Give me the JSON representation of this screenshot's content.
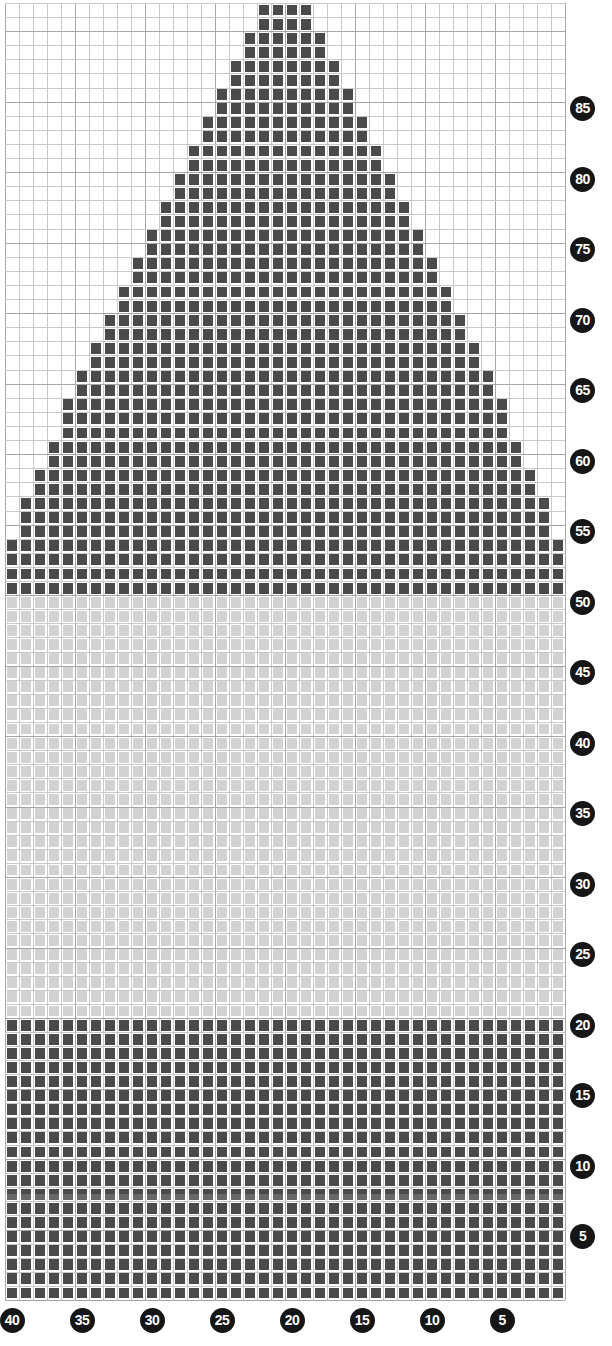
{
  "chart_data": {
    "type": "heatmap",
    "title": "",
    "xlabel": "",
    "ylabel": "",
    "columns": 40,
    "rows": 92,
    "cell_size_px": 14,
    "grid_origin": {
      "x": 5,
      "y": 3
    },
    "column_order": "right-to-left",
    "x_tick_labels": [
      "40",
      "35",
      "30",
      "25",
      "20",
      "15",
      "10",
      "5"
    ],
    "x_tick_values": [
      40,
      35,
      30,
      25,
      20,
      15,
      10,
      5
    ],
    "y_tick_labels": [
      "85",
      "80",
      "75",
      "70",
      "65",
      "60",
      "55",
      "50",
      "45",
      "40",
      "35",
      "30",
      "25",
      "20",
      "15",
      "10",
      "5"
    ],
    "y_tick_values": [
      85,
      80,
      75,
      70,
      65,
      60,
      55,
      50,
      45,
      40,
      35,
      30,
      25,
      20,
      15,
      10,
      5
    ],
    "legend": [],
    "grid": true,
    "colors": {
      "dark": "#4a4a4a",
      "light": "#d2d2d2",
      "empty": "#ffffff",
      "gridline": "#c9c9c9",
      "gridline_major": "#a6a6a6",
      "separator": "#ffffff",
      "marker_fill": "#161616",
      "marker_text": "#ffffff"
    },
    "regions": [
      {
        "name": "lower-dark-band",
        "row_start": 1,
        "row_end": 20,
        "col_start": 1,
        "col_end": 40,
        "fill": "dark"
      },
      {
        "name": "middle-light-band",
        "row_start": 21,
        "row_end": 50,
        "col_start": 1,
        "col_end": 40,
        "fill": "light"
      },
      {
        "name": "pyramid-motif",
        "row_start": 51,
        "row_end": 92,
        "fill": "dark",
        "shape": "triangle",
        "apex_width": 4,
        "base_width": 40,
        "slope_rows_per_stitch": 2
      }
    ],
    "pyramid_rows": [
      {
        "row": 92,
        "col_start": 19,
        "col_end": 22
      },
      {
        "row": 91,
        "col_start": 19,
        "col_end": 22
      },
      {
        "row": 90,
        "col_start": 18,
        "col_end": 23
      },
      {
        "row": 89,
        "col_start": 18,
        "col_end": 23
      },
      {
        "row": 88,
        "col_start": 17,
        "col_end": 24
      },
      {
        "row": 87,
        "col_start": 17,
        "col_end": 24
      },
      {
        "row": 86,
        "col_start": 16,
        "col_end": 25
      },
      {
        "row": 85,
        "col_start": 16,
        "col_end": 25
      },
      {
        "row": 84,
        "col_start": 15,
        "col_end": 26
      },
      {
        "row": 83,
        "col_start": 15,
        "col_end": 26
      },
      {
        "row": 82,
        "col_start": 14,
        "col_end": 27
      },
      {
        "row": 81,
        "col_start": 14,
        "col_end": 27
      },
      {
        "row": 80,
        "col_start": 13,
        "col_end": 28
      },
      {
        "row": 79,
        "col_start": 13,
        "col_end": 28
      },
      {
        "row": 78,
        "col_start": 12,
        "col_end": 29
      },
      {
        "row": 77,
        "col_start": 12,
        "col_end": 29
      },
      {
        "row": 76,
        "col_start": 11,
        "col_end": 30
      },
      {
        "row": 75,
        "col_start": 11,
        "col_end": 30
      },
      {
        "row": 74,
        "col_start": 10,
        "col_end": 31
      },
      {
        "row": 73,
        "col_start": 10,
        "col_end": 31
      },
      {
        "row": 72,
        "col_start": 9,
        "col_end": 32
      },
      {
        "row": 71,
        "col_start": 9,
        "col_end": 32
      },
      {
        "row": 70,
        "col_start": 8,
        "col_end": 33
      },
      {
        "row": 69,
        "col_start": 8,
        "col_end": 33
      },
      {
        "row": 68,
        "col_start": 7,
        "col_end": 34
      },
      {
        "row": 67,
        "col_start": 7,
        "col_end": 34
      },
      {
        "row": 66,
        "col_start": 6,
        "col_end": 35
      },
      {
        "row": 65,
        "col_start": 6,
        "col_end": 35
      },
      {
        "row": 64,
        "col_start": 5,
        "col_end": 36
      },
      {
        "row": 63,
        "col_start": 5,
        "col_end": 36
      },
      {
        "row": 62,
        "col_start": 5,
        "col_end": 36
      },
      {
        "row": 61,
        "col_start": 4,
        "col_end": 37
      },
      {
        "row": 60,
        "col_start": 4,
        "col_end": 37
      },
      {
        "row": 59,
        "col_start": 3,
        "col_end": 38
      },
      {
        "row": 58,
        "col_start": 3,
        "col_end": 38
      },
      {
        "row": 57,
        "col_start": 2,
        "col_end": 39
      },
      {
        "row": 56,
        "col_start": 2,
        "col_end": 39
      },
      {
        "row": 55,
        "col_start": 2,
        "col_end": 39
      },
      {
        "row": 54,
        "col_start": 1,
        "col_end": 40
      },
      {
        "row": 53,
        "col_start": 1,
        "col_end": 40
      },
      {
        "row": 52,
        "col_start": 1,
        "col_end": 40
      },
      {
        "row": 51,
        "col_start": 1,
        "col_end": 40
      }
    ],
    "annotations": [
      {
        "name": "scan-artifact-band",
        "row": 8,
        "note": "faint lighter horizontal streak across the dark band"
      }
    ]
  }
}
